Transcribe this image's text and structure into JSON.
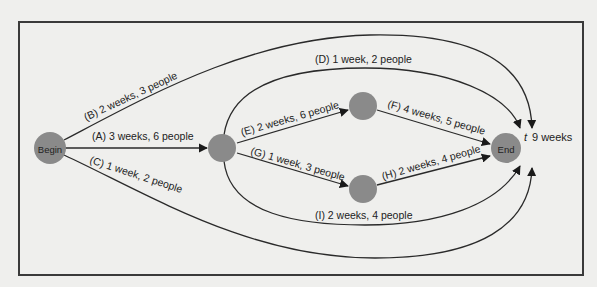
{
  "diagram": {
    "type": "network",
    "nodes": [
      {
        "id": "begin",
        "label": "Begin"
      },
      {
        "id": "n1",
        "label": ""
      },
      {
        "id": "n2",
        "label": ""
      },
      {
        "id": "n3",
        "label": ""
      },
      {
        "id": "end",
        "label": "End"
      }
    ],
    "edges": [
      {
        "id": "A",
        "from": "begin",
        "to": "n1",
        "label": "(A) 3 weeks, 6 people"
      },
      {
        "id": "B",
        "from": "begin",
        "to": "end",
        "label": "(B) 2 weeks, 3 people"
      },
      {
        "id": "C",
        "from": "begin",
        "to": "end",
        "label": "(C) 1 week, 2 people"
      },
      {
        "id": "D",
        "from": "n1",
        "to": "end",
        "label": "(D) 1 week, 2 people"
      },
      {
        "id": "E",
        "from": "n1",
        "to": "n2",
        "label": "(E) 2 weeks, 6 people"
      },
      {
        "id": "F",
        "from": "n2",
        "to": "end",
        "label": "(F) 4 weeks, 5 people"
      },
      {
        "id": "G",
        "from": "n1",
        "to": "n3",
        "label": "(G) 1 week, 3 people"
      },
      {
        "id": "H",
        "from": "n3",
        "to": "end",
        "label": "(H) 2 weeks, 4 people"
      },
      {
        "id": "I",
        "from": "n1",
        "to": "end",
        "label": "(I)  2 weeks, 4 people"
      }
    ],
    "total": {
      "symbol": "t",
      "value": "9 weeks"
    }
  },
  "colors": {
    "node": "#8a8a8a",
    "edge": "#2a2a2a",
    "background": "#efefed",
    "frame": "#3a3a3a"
  }
}
